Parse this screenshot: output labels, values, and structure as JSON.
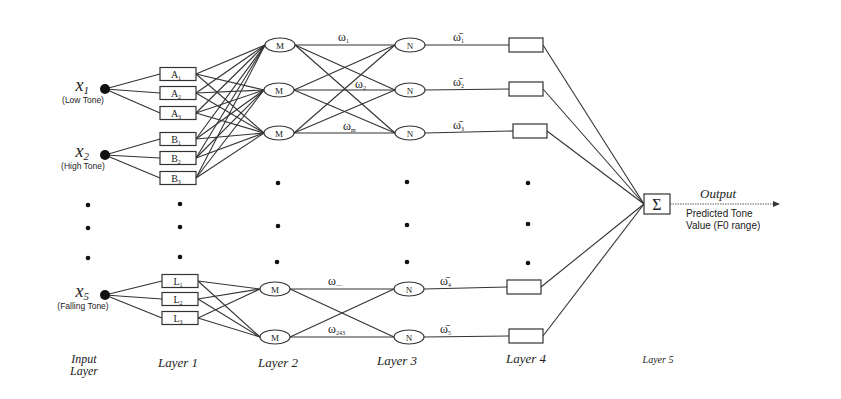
{
  "diagram": {
    "type": "neural-fuzzy-network",
    "inputs": [
      {
        "symbol": "x",
        "sub": "1",
        "label": "(Low Tone)",
        "x": 105,
        "y": 89
      },
      {
        "symbol": "x",
        "sub": "2",
        "label": "(High Tone)",
        "x": 105,
        "y": 155
      },
      {
        "symbol": "x",
        "sub": "5",
        "label": "(Falling Tone)",
        "x": 105,
        "y": 295
      }
    ],
    "layer1": [
      {
        "letter": "A",
        "sub": "1",
        "x": 178,
        "y": 74,
        "input": 0
      },
      {
        "letter": "A",
        "sub": "2",
        "x": 178,
        "y": 93,
        "input": 0
      },
      {
        "letter": "A",
        "sub": "3",
        "x": 178,
        "y": 113,
        "input": 0
      },
      {
        "letter": "B",
        "sub": "1",
        "x": 178,
        "y": 139,
        "input": 1
      },
      {
        "letter": "B",
        "sub": "2",
        "x": 178,
        "y": 158,
        "input": 1
      },
      {
        "letter": "B",
        "sub": "3",
        "x": 178,
        "y": 178,
        "input": 1
      },
      {
        "letter": "L",
        "sub": "1",
        "x": 180,
        "y": 281,
        "input": 2
      },
      {
        "letter": "L",
        "sub": "2",
        "x": 180,
        "y": 299,
        "input": 2
      },
      {
        "letter": "L",
        "sub": "3",
        "x": 180,
        "y": 318,
        "input": 2
      }
    ],
    "layer2": [
      {
        "label": "M",
        "x": 280,
        "y": 45
      },
      {
        "label": "M",
        "x": 279,
        "y": 90
      },
      {
        "label": "M",
        "x": 279,
        "y": 133
      },
      {
        "label": "M",
        "x": 275,
        "y": 289
      },
      {
        "label": "M",
        "x": 275,
        "y": 337
      }
    ],
    "layer3": [
      {
        "label": "N",
        "x": 410,
        "y": 45
      },
      {
        "label": "N",
        "x": 410,
        "y": 90
      },
      {
        "label": "N",
        "x": 410,
        "y": 133
      },
      {
        "label": "N",
        "x": 409,
        "y": 289
      },
      {
        "label": "N",
        "x": 409,
        "y": 337
      }
    ],
    "layer4": [
      {
        "x": 526,
        "y": 45
      },
      {
        "x": 526,
        "y": 89
      },
      {
        "x": 530,
        "y": 131
      },
      {
        "x": 524,
        "y": 287
      },
      {
        "x": 526,
        "y": 336
      }
    ],
    "layer5": {
      "symbol": "Σ",
      "x": 656,
      "y": 204
    },
    "weights_layer2_3": [
      {
        "text": "ω",
        "sub": "1",
        "x": 338,
        "y": 41
      },
      {
        "text": "ω",
        "sub": "2",
        "x": 355,
        "y": 88
      },
      {
        "text": "ω",
        "sub": "m",
        "x": 343,
        "y": 130
      },
      {
        "text": "ω",
        "sub": "—",
        "x": 328,
        "y": 285
      },
      {
        "text": "ω",
        "sub": "243",
        "x": 328,
        "y": 333
      }
    ],
    "weights_layer3_4": [
      {
        "text": "ω̄",
        "sub": "1",
        "x": 453,
        "y": 41
      },
      {
        "text": "ω̄",
        "sub": "2",
        "x": 453,
        "y": 86
      },
      {
        "text": "ω̄",
        "sub": "3",
        "x": 453,
        "y": 129
      },
      {
        "text": "ω̄",
        "sub": "4",
        "x": 440,
        "y": 285
      },
      {
        "text": "ω̄",
        "sub": "5",
        "x": 440,
        "y": 333
      }
    ],
    "output": {
      "label": "Output",
      "description_line1": "Predicted Tone",
      "description_line2": "Value (F0 range)"
    },
    "ellipsis_dots": [
      {
        "x": 88,
        "y": 205
      },
      {
        "x": 88,
        "y": 228
      },
      {
        "x": 88,
        "y": 258
      },
      {
        "x": 180,
        "y": 204
      },
      {
        "x": 180,
        "y": 227
      },
      {
        "x": 180,
        "y": 257
      },
      {
        "x": 278,
        "y": 183
      },
      {
        "x": 278,
        "y": 226
      },
      {
        "x": 277,
        "y": 262
      },
      {
        "x": 407,
        "y": 182
      },
      {
        "x": 407,
        "y": 225
      },
      {
        "x": 407,
        "y": 262
      },
      {
        "x": 528,
        "y": 183
      },
      {
        "x": 528,
        "y": 224
      },
      {
        "x": 528,
        "y": 263
      }
    ],
    "layer_labels": [
      {
        "line1": "Input",
        "line2": "Layer",
        "x": 84,
        "y": 363
      },
      {
        "line1": "Layer 1",
        "line2": "",
        "x": 178,
        "y": 367
      },
      {
        "line1": "Layer 2",
        "line2": "",
        "x": 278,
        "y": 367
      },
      {
        "line1": "Layer 3",
        "line2": "",
        "x": 397,
        "y": 365
      },
      {
        "line1": "Layer 4",
        "line2": "",
        "x": 526,
        "y": 363
      },
      {
        "line1": "Layer 5",
        "line2": "",
        "x": 658,
        "y": 363
      }
    ]
  }
}
